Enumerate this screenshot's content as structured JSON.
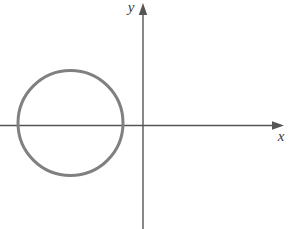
{
  "figure": {
    "background_color": "#ffffff",
    "width": 294,
    "height": 229
  },
  "axes": {
    "x_axis": {
      "label": "x",
      "label_x": 281,
      "label_y": 141,
      "line_y": 125.5,
      "line_x_start": 0,
      "line_x_end": 283,
      "color": "#555555",
      "stroke_width": 1.4,
      "arrow_tip_x": 284,
      "arrow_back_x": 272,
      "arrow_half_height": 4.2
    },
    "y_axis": {
      "label": "y",
      "label_x": 131,
      "label_y": 12,
      "line_x": 143,
      "line_y_start": 4,
      "line_y_end": 229,
      "color": "#555555",
      "stroke_width": 1.4,
      "arrow_tip_y": 3,
      "arrow_back_y": 15,
      "arrow_half_width": 4.2
    },
    "origin": {
      "x": 143,
      "y": 125.5
    }
  },
  "chart_data": {
    "type": "scatter",
    "xlabel": "x",
    "ylabel": "y",
    "grid": false,
    "legend": null,
    "shapes": [
      {
        "kind": "circle",
        "name": "circle-curve",
        "center_px": {
          "x": 70.5,
          "y": 123
        },
        "radius_px": 52.5,
        "center_data": {
          "x": -1,
          "y": 0
        },
        "radius_data": 1,
        "stroke": "#808080",
        "stroke_width": 3,
        "fill": "none",
        "passes_through_origin": true,
        "x_intercepts_data": [
          -2,
          0
        ],
        "equation": "(x + 1)^2 + y^2 = 1"
      }
    ],
    "annotations": []
  },
  "colors": {
    "curve": "#808080",
    "axis": "#555555",
    "label": "#3b3b3b",
    "background": "#ffffff"
  }
}
